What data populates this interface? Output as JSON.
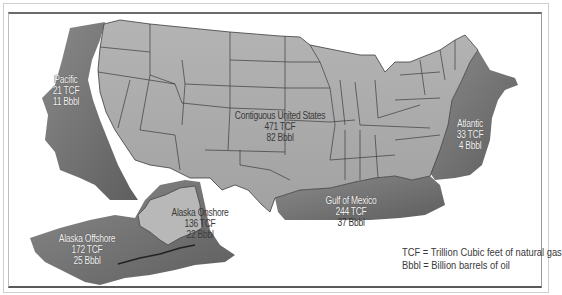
{
  "regions": [
    {
      "id": "pacific",
      "name": "Pacific",
      "gas": "21 TCF",
      "oil": "11 Bbbl",
      "type": "offshore"
    },
    {
      "id": "contiguous",
      "name": "Contiguous United States",
      "gas": "471 TCF",
      "oil": "82 Bbbl",
      "type": "onshore"
    },
    {
      "id": "atlantic",
      "name": "Atlantic",
      "gas": "33 TCF",
      "oil": "4 Bbbl",
      "type": "offshore"
    },
    {
      "id": "gulf",
      "name": "Gulf of Mexico",
      "gas": "244 TCF",
      "oil": "37 Bbbl",
      "type": "offshore"
    },
    {
      "id": "alaska-onshore",
      "name": "Alaska Onshore",
      "gas": "136 TCF",
      "oil": "22 Bbbl",
      "type": "onshore"
    },
    {
      "id": "alaska-offshore",
      "name": "Alaska Offshore",
      "gas": "172 TCF",
      "oil": "25 Bbbl",
      "type": "offshore"
    }
  ],
  "legend": {
    "tcf": "TCF = Trillion Cubic feet of natural gas",
    "bbbl": "Bbbl = Billion barrels of oil"
  },
  "colors": {
    "land": "#a9a9a9",
    "offshore": "#6e6e6e",
    "border": "#3c3c3c",
    "frame": "#6a6a6a"
  }
}
